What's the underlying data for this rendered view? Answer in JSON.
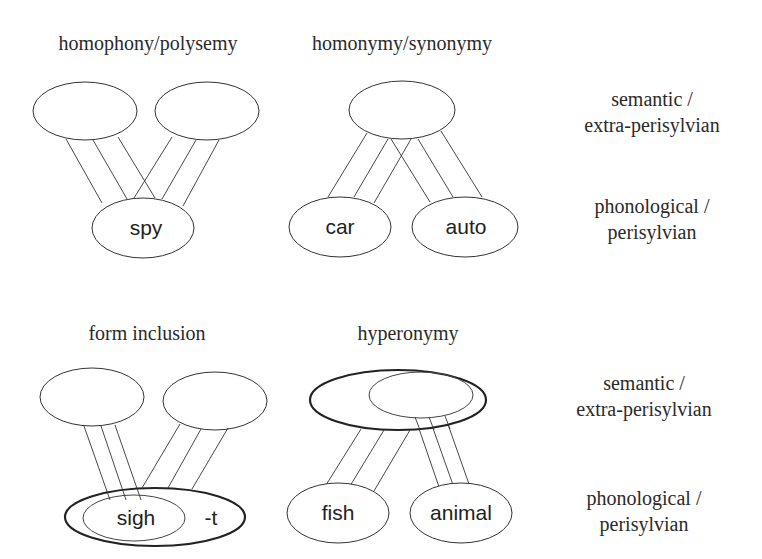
{
  "panels": {
    "homophony": {
      "title": "homophony/polysemy",
      "phonological_word": "spy",
      "semantic_nodes": 2,
      "phonological_nodes": 1
    },
    "homonymy": {
      "title": "homonymy/synonymy",
      "phonological_words": [
        "car",
        "auto"
      ],
      "word_left": "car",
      "word_right": "auto",
      "semantic_nodes": 1,
      "phonological_nodes": 2
    },
    "form_inclusion": {
      "title": "form inclusion",
      "inner_word": "sigh",
      "suffix": "-t",
      "semantic_nodes": 2,
      "phonological_nodes": 1
    },
    "hyperonymy": {
      "title": "hyperonymy",
      "word_left": "fish",
      "word_right": "animal",
      "semantic_nodes": 1,
      "phonological_nodes": 2
    }
  },
  "level_labels": {
    "top_row": {
      "semantic_line1": "semantic /",
      "semantic_line2": "extra-perisylvian",
      "phonological_line1": "phonological /",
      "phonological_line2": "perisylvian"
    },
    "bottom_row": {
      "semantic_line1": "semantic /",
      "semantic_line2": "extra-perisylvian",
      "phonological_line1": "phonological /",
      "phonological_line2": "perisylvian"
    }
  },
  "colors": {
    "background": "#ffffff",
    "stroke": "#333333",
    "text": "#2a2a2a"
  }
}
